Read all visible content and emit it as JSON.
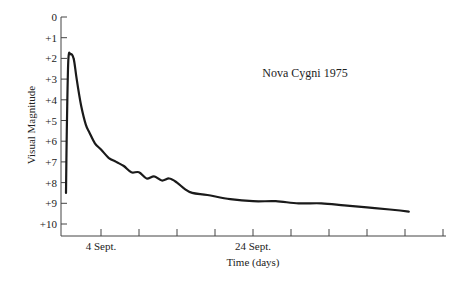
{
  "chart_data": {
    "type": "line",
    "title": "Nova Cygni 1975",
    "xlabel": "Time (days)",
    "ylabel": "Visual Magnitude",
    "y_inverted": true,
    "ylim": [
      0,
      10
    ],
    "ytick_labels": [
      "0",
      "+1",
      "+2",
      "+3",
      "+4",
      "+5",
      "+6",
      "+7",
      "+8",
      "+9",
      "+10"
    ],
    "xtick_labels": [
      {
        "pos": 0,
        "label": "4 Sept."
      },
      {
        "pos": 4,
        "label": "24 Sept."
      }
    ],
    "x_tick_count": 10,
    "x_tick_spacing_days": 5,
    "grid": false,
    "legend": null,
    "series": [
      {
        "name": "Nova Cygni 1975",
        "x_days_from_4sept": [
          -4.6,
          -4.5,
          -4.3,
          -4.0,
          -3.6,
          -3.2,
          -2.6,
          -2.0,
          -1.5,
          -0.8,
          0,
          1.0,
          2.0,
          3.0,
          4.0,
          5.0,
          6.0,
          7.0,
          8.0,
          9.0,
          10.0,
          11.0,
          12.0,
          14.0,
          17.0,
          20.0,
          23.0,
          26.0,
          29.0,
          32.0,
          35.0,
          38.0,
          40.5
        ],
        "magnitude": [
          8.5,
          5.5,
          2.1,
          1.8,
          2.0,
          3.0,
          4.3,
          5.2,
          5.6,
          6.1,
          6.4,
          6.8,
          7.0,
          7.2,
          7.5,
          7.5,
          7.8,
          7.7,
          7.9,
          7.8,
          8.0,
          8.3,
          8.5,
          8.6,
          8.8,
          8.9,
          8.9,
          9.0,
          9.0,
          9.1,
          9.2,
          9.3,
          9.4
        ]
      }
    ]
  }
}
